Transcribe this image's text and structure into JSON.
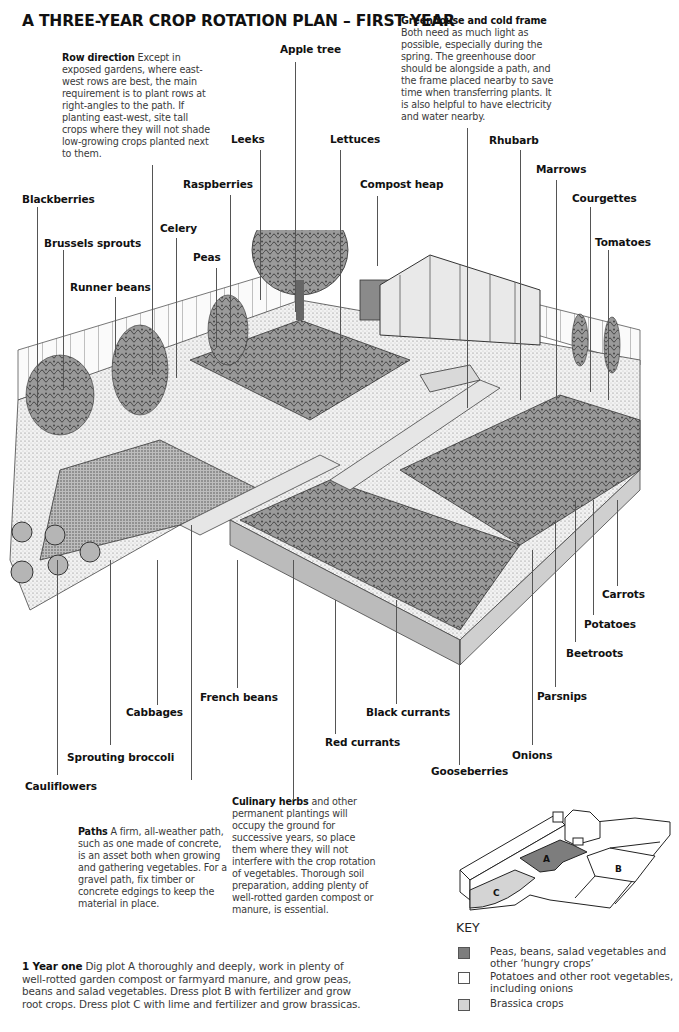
{
  "title": "A THREE-YEAR CROP ROTATION PLAN – FIRST YEAR",
  "notes": {
    "row_direction": {
      "heading": "Row direction",
      "body": "Except in exposed gardens, where east-west rows are best, the main requirement is to plant rows at right-angles to the path. If planting east-west, site tall crops where they will not shade low-growing crops planted next to them."
    },
    "greenhouse": {
      "heading": "Greenhouse and cold frame",
      "body": "Both need as much light as possible, especially during the spring. The greenhouse door should be alongside a path, and the frame placed nearby to save time when transferring plants. It is also helpful to have electricity and water nearby."
    },
    "paths": {
      "heading": "Paths",
      "body": "A firm, all-weather path, such as one made of concrete, is an asset both when growing and gathering vegetables. For a gravel path, fix timber or concrete edgings to keep the material in place."
    },
    "culinary_herbs": {
      "heading": "Culinary herbs",
      "body": "and other permanent plantings will occupy the ground for successive years, so place them where they will not interfere with the crop rotation of vegetables. Thorough soil preparation, adding plenty of well-rotted garden compost or manure, is essential."
    }
  },
  "labels": {
    "apple_tree": "Apple tree",
    "leeks": "Leeks",
    "lettuces": "Lettuces",
    "raspberries": "Raspberries",
    "compost_heap": "Compost heap",
    "rhubarb": "Rhubarb",
    "marrows": "Marrows",
    "courgettes": "Courgettes",
    "tomatoes": "Tomatoes",
    "blackberries": "Blackberries",
    "brussels_sprouts": "Brussels sprouts",
    "celery": "Celery",
    "peas": "Peas",
    "runner_beans": "Runner beans",
    "carrots": "Carrots",
    "potatoes": "Potatoes",
    "beetroots": "Beetroots",
    "parsnips": "Parsnips",
    "onions": "Onions",
    "gooseberries": "Gooseberries",
    "black_currants": "Black currants",
    "red_currants": "Red currants",
    "french_beans": "French beans",
    "cabbages": "Cabbages",
    "sprouting_broccoli": "Sprouting broccoli",
    "cauliflowers": "Cauliflowers"
  },
  "plan": {
    "plot_a": "A",
    "plot_b": "B",
    "plot_c": "C",
    "colors": {
      "plot_a": "#7d7d7d",
      "plot_b": "#ffffff",
      "plot_c": "#d4d4d4"
    }
  },
  "key": {
    "title": "KEY",
    "items": [
      {
        "color": "#7d7d7d",
        "text": "Peas, beans, salad vegetables and other ‘hungry crops’"
      },
      {
        "color": "#ffffff",
        "text": "Potatoes and other root vegetables, including onions"
      },
      {
        "color": "#d4d4d4",
        "text": "Brassica crops"
      }
    ]
  },
  "year_one": {
    "heading": "1 Year one",
    "body": "Dig plot A thoroughly and deeply, work in plenty of well-rotted garden compost or farmyard manure, and grow peas, beans and salad vegetables. Dress plot B with fertilizer and grow root crops. Dress plot C with lime and fertilizer and grow brassicas."
  }
}
